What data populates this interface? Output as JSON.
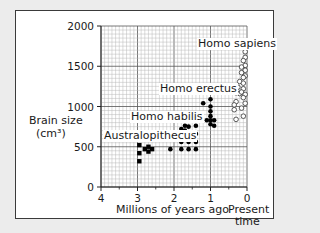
{
  "chart_data": {
    "type": "scatter",
    "title": "",
    "xlabel": "Millions of years ago",
    "ylabel": "Brain size",
    "ylabel_units": "(cm³)",
    "x_tick_labels": [
      "4",
      "3",
      "2",
      "1",
      "0"
    ],
    "x_present_label": "Present",
    "x_present_label_2": "time",
    "y_tick_labels": [
      "0",
      "500",
      "1000",
      "1500",
      "2000"
    ],
    "xlim": [
      4,
      0
    ],
    "ylim": [
      0,
      2000
    ],
    "grid": true,
    "legend": "inline labels",
    "series": [
      {
        "name": "Australopithecus",
        "marker": "filled-square",
        "points": [
          [
            2.95,
            520
          ],
          [
            2.95,
            420
          ],
          [
            2.95,
            320
          ],
          [
            2.8,
            470
          ],
          [
            2.7,
            500
          ],
          [
            2.6,
            470
          ],
          [
            2.7,
            440
          ]
        ]
      },
      {
        "name": "Homo habilis",
        "marker": "filled-circle",
        "points": [
          [
            2.1,
            470
          ],
          [
            1.8,
            470
          ],
          [
            1.8,
            560
          ],
          [
            1.8,
            650
          ],
          [
            1.8,
            720
          ],
          [
            1.7,
            760
          ],
          [
            1.6,
            750
          ],
          [
            1.6,
            640
          ],
          [
            1.6,
            560
          ],
          [
            1.6,
            470
          ],
          [
            1.4,
            470
          ],
          [
            1.4,
            560
          ],
          [
            1.4,
            660
          ],
          [
            1.4,
            760
          ],
          [
            1.75,
            600
          ],
          [
            1.7,
            700
          ]
        ]
      },
      {
        "name": "Homo erectus",
        "marker": "filled-circle",
        "points": [
          [
            1.2,
            1040
          ],
          [
            1.0,
            1090
          ],
          [
            1.0,
            1000
          ],
          [
            1.0,
            940
          ],
          [
            1.0,
            880
          ],
          [
            1.0,
            830
          ],
          [
            1.0,
            780
          ],
          [
            1.1,
            830
          ],
          [
            0.9,
            830
          ],
          [
            0.9,
            760
          ]
        ]
      },
      {
        "name": "Homo sapiens",
        "marker": "open-circle",
        "points": [
          [
            0.05,
            1680
          ],
          [
            0.05,
            1610
          ],
          [
            0.1,
            1570
          ],
          [
            0.05,
            1510
          ],
          [
            0.15,
            1490
          ],
          [
            0.05,
            1450
          ],
          [
            0.15,
            1420
          ],
          [
            0.05,
            1380
          ],
          [
            0.1,
            1360
          ],
          [
            0.2,
            1310
          ],
          [
            0.1,
            1290
          ],
          [
            0.25,
            1240
          ],
          [
            0.1,
            1220
          ],
          [
            0.3,
            1170
          ],
          [
            0.2,
            1160
          ],
          [
            0.15,
            1180
          ],
          [
            0.05,
            1150
          ],
          [
            0.1,
            1110
          ],
          [
            0.3,
            1060
          ],
          [
            0.05,
            1040
          ],
          [
            0.35,
            1020
          ],
          [
            0.15,
            980
          ],
          [
            0.35,
            960
          ],
          [
            0.1,
            880
          ],
          [
            0.3,
            840
          ]
        ]
      }
    ]
  },
  "labels": {
    "species": [
      "Homo sapiens",
      "Homo erectus",
      "Homo habilis",
      "Australopithecus"
    ]
  }
}
